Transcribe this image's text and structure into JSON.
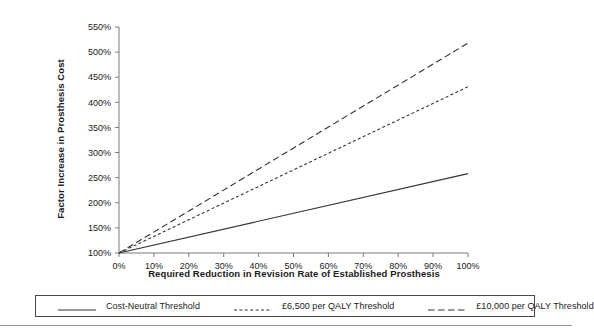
{
  "chart_data": {
    "type": "line",
    "title": "",
    "xlabel": "Required Reduction in Revision Rate of Established Prosthesis",
    "ylabel": "Factor Increase in Prosthesis Cost",
    "xlim": [
      0,
      100
    ],
    "ylim": [
      100,
      550
    ],
    "xticks": [
      "0%",
      "10%",
      "20%",
      "30%",
      "40%",
      "50%",
      "60%",
      "70%",
      "80%",
      "90%",
      "100%"
    ],
    "xtick_values": [
      0,
      10,
      20,
      30,
      40,
      50,
      60,
      70,
      80,
      90,
      100
    ],
    "yticks": [
      "100%",
      "150%",
      "200%",
      "250%",
      "300%",
      "350%",
      "400%",
      "450%",
      "500%",
      "550%"
    ],
    "ytick_values": [
      100,
      150,
      200,
      250,
      300,
      350,
      400,
      450,
      500,
      550
    ],
    "grid": false,
    "legend_position": "below",
    "series": [
      {
        "name": "Cost-Neutral Threshold",
        "style": "solid",
        "x": [
          0,
          100
        ],
        "values": [
          100,
          258
        ]
      },
      {
        "name": "£6,500 per QALY Threshold",
        "style": "dotted",
        "x": [
          0,
          100
        ],
        "values": [
          100,
          431
        ]
      },
      {
        "name": "£10,000 per QALY Threshold",
        "style": "dashed",
        "x": [
          0,
          100
        ],
        "values": [
          100,
          518
        ]
      }
    ]
  },
  "legend": {
    "items": [
      {
        "label": "Cost-Neutral Threshold",
        "style": "solid"
      },
      {
        "label": "£6,500 per QALY Threshold",
        "style": "dotted"
      },
      {
        "label": "£10,000 per QALY Threshold",
        "style": "dashed"
      }
    ]
  },
  "colors": {
    "line": "#333333",
    "axis": "#7a7a7a",
    "text": "#1a1a1a",
    "legend_border": "#4a4a4a",
    "rule": "#9a9a9a"
  }
}
